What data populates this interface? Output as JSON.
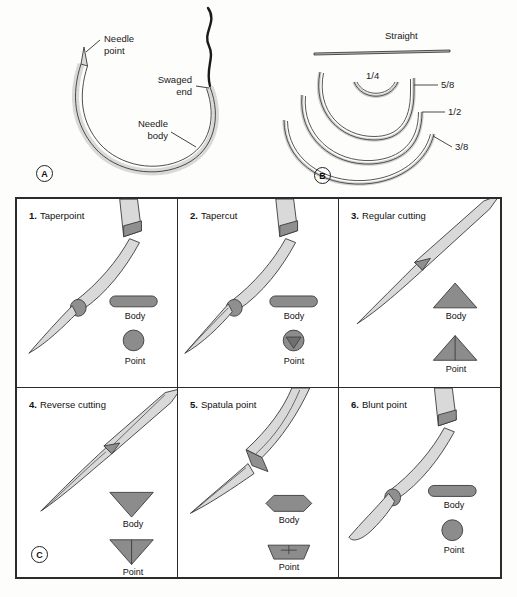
{
  "figure": {
    "panels": [
      {
        "id": "A",
        "badge": "A",
        "name": "needle-anatomy",
        "labels": [
          {
            "key": "needle_point",
            "text": "Needle\npoint"
          },
          {
            "key": "swaged_end",
            "text": "Swaged\nend"
          },
          {
            "key": "needle_body",
            "text": "Needle\nbody"
          }
        ]
      },
      {
        "id": "B",
        "badge": "B",
        "name": "needle-curvature",
        "labels": [
          {
            "key": "straight",
            "text": "Straight"
          },
          {
            "key": "quarter",
            "text": "1/4"
          },
          {
            "key": "five_eighths",
            "text": "5/8"
          },
          {
            "key": "half",
            "text": "1/2"
          },
          {
            "key": "three_eighths",
            "text": "3/8"
          }
        ]
      },
      {
        "id": "C",
        "badge": "C",
        "name": "needle-point-types"
      }
    ]
  },
  "cross_section": {
    "body_label": "Body",
    "point_label": "Point"
  },
  "needle_types": [
    {
      "number": "1.",
      "name": "Taperpoint",
      "body_shape": "oval",
      "point_shape": "circle"
    },
    {
      "number": "2.",
      "name": "Tapercut",
      "body_shape": "oval",
      "point_shape": "circle-triangle"
    },
    {
      "number": "3.",
      "name": "Regular cutting",
      "body_shape": "triangle-up",
      "point_shape": "triangle-up-split"
    },
    {
      "number": "4.",
      "name": "Reverse cutting",
      "body_shape": "triangle-down",
      "point_shape": "triangle-down-split"
    },
    {
      "number": "5.",
      "name": "Spatula point",
      "body_shape": "hexagon",
      "point_shape": "trapezoid-split"
    },
    {
      "number": "6.",
      "name": "Blunt point",
      "body_shape": "oval",
      "point_shape": "circle"
    }
  ],
  "colors": {
    "shaft_fill": "#d9d9d9",
    "shaft_stroke": "#3a3a3a",
    "tip_fill": "#8f8f8f",
    "xsec_fill": "#8c8c8c",
    "xsec_stroke": "#3a3a3a",
    "thread": "#1a1a1a",
    "panel_border": "#2b2b2b",
    "text": "#1a1a1a",
    "background": "#fdfdfc"
  }
}
